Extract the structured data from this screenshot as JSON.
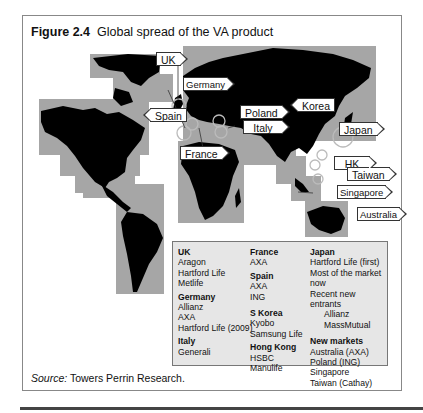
{
  "figure": {
    "label": "Figure 2.4",
    "title": "Global spread of the VA product",
    "source_label": "Source:",
    "source_text": " Towers Perrin Research."
  },
  "map": {
    "background_color": "#a6a6a6",
    "land_color": "#000000",
    "callouts": [
      {
        "id": "uk",
        "label": "UK",
        "direction": "right"
      },
      {
        "id": "germany",
        "label": "Germany",
        "direction": "right"
      },
      {
        "id": "spain",
        "label": "Spain",
        "direction": "left"
      },
      {
        "id": "poland",
        "label": "Poland",
        "direction": "right"
      },
      {
        "id": "italy",
        "label": "Italy",
        "direction": "right"
      },
      {
        "id": "france",
        "label": "France",
        "direction": "right"
      },
      {
        "id": "korea",
        "label": "Korea",
        "direction": "left"
      },
      {
        "id": "japan",
        "label": "Japan",
        "direction": "right"
      },
      {
        "id": "hk",
        "label": "HK",
        "direction": "right"
      },
      {
        "id": "taiwan",
        "label": "Taiwan",
        "direction": "right"
      },
      {
        "id": "singapore",
        "label": "Singapore",
        "direction": "right"
      },
      {
        "id": "australia",
        "label": "Australia",
        "direction": "right"
      }
    ]
  },
  "legend": {
    "columns": [
      {
        "groups": [
          {
            "heading": "UK",
            "items": [
              "Aragon",
              "Hartford Life",
              "Metlife"
            ]
          },
          {
            "heading": "Germany",
            "items": [
              "Allianz",
              "AXA",
              "Hartford Life (2009)"
            ]
          },
          {
            "heading": "Italy",
            "items": [
              "Generali"
            ]
          }
        ]
      },
      {
        "groups": [
          {
            "heading": "France",
            "items": [
              "AXA"
            ]
          },
          {
            "heading": "Spain",
            "items": [
              "AXA",
              "ING"
            ]
          },
          {
            "heading": "S Korea",
            "items": [
              "Kyobo",
              "Samsung Life"
            ]
          },
          {
            "heading": "Hong Kong",
            "items": [
              "HSBC",
              "Manulife"
            ]
          }
        ]
      },
      {
        "groups": [
          {
            "heading": "Japan",
            "items": [
              "Hartford Life (first)",
              "Most of the market now",
              "Recent new entrants"
            ],
            "sub_items": [
              "Allianz",
              "MassMutual"
            ]
          },
          {
            "heading": "New markets",
            "items": [
              "Australia (AXA)",
              "Poland (ING)",
              "Singapore",
              "Taiwan (Cathay)"
            ]
          }
        ]
      }
    ]
  }
}
